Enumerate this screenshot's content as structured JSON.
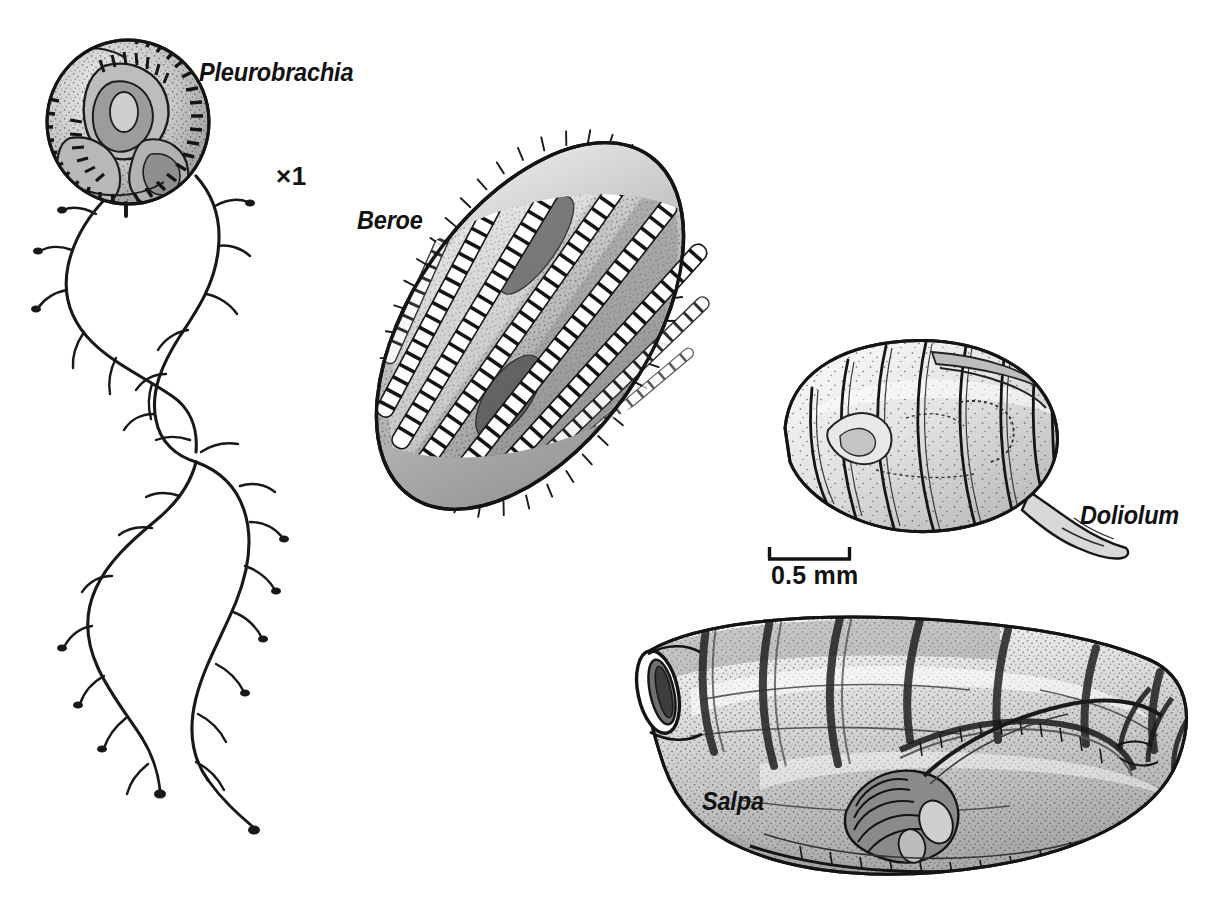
{
  "figure": {
    "kind": "scientific-illustration-plate",
    "background_color": "#ffffff",
    "ink_color": "#121212",
    "width": 1212,
    "height": 920
  },
  "labels": {
    "pleurobrachia": "Pleurobrachia",
    "beroe": "Beroe",
    "doliolum": "Doliolum",
    "salpa": "Salpa",
    "magnification": "×1",
    "scale": "0.5 mm"
  },
  "specimens": [
    {
      "name": "Pleurobrachia",
      "label": "Pleurobrachia",
      "group": "ctenophore",
      "description": "Round sea gooseberry body with eight meridional comb rows and two long branched trailing tentacles",
      "magnification_note": "×1",
      "position": {
        "x": 40,
        "y": 40,
        "width": 270,
        "height": 790
      },
      "comb_rows": 8,
      "tentacles": 2
    },
    {
      "name": "Beroe",
      "label": "Beroe",
      "group": "ctenophore",
      "description": "Large elongate ovoid lobeless ctenophore tilted about 55 degrees with eight ladder-like ciliated comb rows and a ciliated margin",
      "position": {
        "x": 320,
        "y": 130,
        "width": 420,
        "height": 390
      },
      "comb_rows": 8,
      "tilt_degrees": 55
    },
    {
      "name": "Doliolum",
      "label": "Doliolum",
      "group": "thaliacean",
      "description": "Barrel-shaped doliolid with eight complete encircling muscle bands and a small tapering tail process at lower right",
      "position": {
        "x": 760,
        "y": 330,
        "width": 320,
        "height": 240
      },
      "muscle_bands": 8
    },
    {
      "name": "Salpa",
      "label": "Salpa",
      "group": "thaliacean",
      "description": "Large transparent barrel-shaped salp with open oral siphon at left, incomplete muscle bands and a dark visceral nucleus with coiled gut",
      "position": {
        "x": 620,
        "y": 605,
        "width": 590,
        "height": 290
      },
      "muscle_bands": 7
    }
  ],
  "scale_bar": {
    "label": "0.5 mm",
    "x_start": 768,
    "x_end": 851,
    "y": 559,
    "tick_height": 13,
    "orientation": "horizontal",
    "applies_to": [
      "Beroe",
      "Doliolum",
      "Salpa"
    ]
  },
  "magnification_marker": {
    "label": "×1",
    "applies_to": [
      "Pleurobrachia"
    ]
  }
}
